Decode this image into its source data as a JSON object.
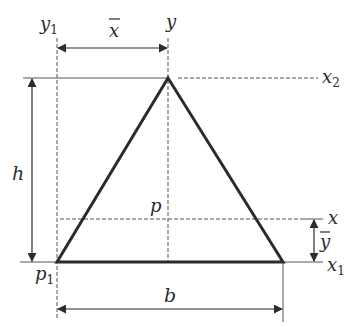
{
  "figure": {
    "colors": {
      "shape_stroke": "#2b2b2b",
      "line": "#555555",
      "text": "#2a2a2a",
      "background": "#ffffff"
    },
    "shape": {
      "type": "triangle",
      "vertices": {
        "apex": [
          168,
          78
        ],
        "bottom_left": [
          57,
          262
        ],
        "bottom_right": [
          283,
          262
        ]
      }
    },
    "labels": {
      "y1": {
        "base": "y",
        "sub": "1"
      },
      "y": {
        "base": "y"
      },
      "x_bar": {
        "base": "x",
        "accent": "‾"
      },
      "x2": {
        "base": "x",
        "sub": "2"
      },
      "h": {
        "base": "h"
      },
      "p": {
        "base": "p"
      },
      "x": {
        "base": "x"
      },
      "y_bar": {
        "base": "y",
        "accent": "‾"
      },
      "p1": {
        "base": "p",
        "sub": "1"
      },
      "x1": {
        "base": "x",
        "sub": "1"
      },
      "b": {
        "base": "b"
      }
    },
    "dimensions": [
      {
        "name": "x_bar",
        "label": "x̄",
        "meaning": "horizontal distance from y1 axis to y axis (centroid)"
      },
      {
        "name": "h",
        "label": "h",
        "meaning": "height of triangle"
      },
      {
        "name": "y_bar",
        "label": "ȳ",
        "meaning": "vertical distance from x1 axis to centroidal x axis"
      },
      {
        "name": "b",
        "label": "b",
        "meaning": "base width of triangle"
      }
    ],
    "points": [
      {
        "name": "p",
        "label": "p",
        "meaning": "centroid"
      },
      {
        "name": "p1",
        "label": "p₁",
        "meaning": "bottom-left corner origin"
      }
    ]
  }
}
